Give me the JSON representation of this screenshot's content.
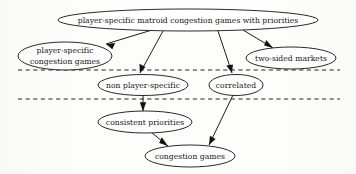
{
  "figure": {
    "kind": "hierarchy-diagram",
    "background_color": "#fdfdfc",
    "ink_color": "#14110f",
    "divider_color": "#2a2623"
  },
  "nodes": [
    {
      "id": "psmcgp",
      "label": "player-specific matroid congestion games with priorities",
      "lines": [
        "player-specific matroid congestion games with priorities"
      ],
      "cx": 188,
      "cy": 20,
      "rx": 130,
      "ry": 11
    },
    {
      "id": "pscg",
      "label": "player-specific congestion games",
      "lines": [
        "player-specific",
        "congestion games"
      ],
      "cx": 65,
      "cy": 56,
      "rx": 47,
      "ry": 14
    },
    {
      "id": "tsm",
      "label": "two-sided markets",
      "lines": [
        "two-sided markets"
      ],
      "cx": 291,
      "cy": 58,
      "rx": 45,
      "ry": 11
    },
    {
      "id": "nps",
      "label": "non player-specific",
      "lines": [
        "non player-specific"
      ],
      "cx": 143,
      "cy": 85,
      "rx": 45,
      "ry": 10.5
    },
    {
      "id": "corr",
      "label": "correlated",
      "lines": [
        "correlated"
      ],
      "cx": 236,
      "cy": 85,
      "rx": 27,
      "ry": 10.5
    },
    {
      "id": "cp",
      "label": "consistent priorities",
      "lines": [
        "consistent priorities"
      ],
      "cx": 145,
      "cy": 122,
      "rx": 47,
      "ry": 11
    },
    {
      "id": "cg",
      "label": "congestion games",
      "lines": [
        "congestion games"
      ],
      "cx": 190,
      "cy": 156,
      "rx": 45,
      "ry": 11
    }
  ],
  "edges": [
    {
      "from": "psmcgp",
      "to": "pscg",
      "label": ""
    },
    {
      "from": "psmcgp",
      "to": "nps",
      "label": ""
    },
    {
      "from": "psmcgp",
      "to": "corr",
      "label": ""
    },
    {
      "from": "psmcgp",
      "to": "tsm",
      "label": ""
    },
    {
      "from": "nps",
      "to": "cp",
      "label": ""
    },
    {
      "from": "cp",
      "to": "cg",
      "label": ""
    },
    {
      "from": "corr",
      "to": "cg",
      "label": ""
    }
  ],
  "dividers": [
    {
      "id": "divider-upper",
      "y": 70,
      "x1": 18,
      "x2": 340
    },
    {
      "id": "divider-lower",
      "y": 99,
      "x1": 18,
      "x2": 340
    }
  ]
}
